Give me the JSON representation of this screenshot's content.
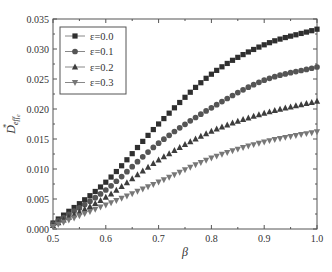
{
  "chart_data": {
    "type": "scatter",
    "title": "",
    "xlabel": "β",
    "ylabel": "D*_eff_e",
    "xlim": [
      0.5,
      1.0
    ],
    "ylim": [
      0.0,
      0.035
    ],
    "xticks": [
      0.5,
      0.6,
      0.7,
      0.8,
      0.9,
      1.0
    ],
    "xtick_labels": [
      "0.5",
      "0.6",
      "0.7",
      "0.8",
      "0.9",
      "1.0"
    ],
    "yticks": [
      0.0,
      0.005,
      0.01,
      0.015,
      0.02,
      0.025,
      0.03,
      0.035
    ],
    "ytick_labels": [
      "0.000",
      "0.005",
      "0.010",
      "0.015",
      "0.020",
      "0.025",
      "0.030",
      "0.035"
    ],
    "grid": false,
    "legend_position": "top-left",
    "x": [
      0.5,
      0.6,
      0.7,
      0.8,
      0.9,
      1.0
    ],
    "series": [
      {
        "name": "ε=0.0",
        "marker": "square",
        "color": "#2f2f2f",
        "values": [
          0.001,
          0.0078,
          0.0175,
          0.0258,
          0.0307,
          0.0333
        ]
      },
      {
        "name": "ε=0.1",
        "marker": "circle",
        "color": "#555555",
        "values": [
          0.0008,
          0.0065,
          0.0143,
          0.0202,
          0.0248,
          0.027
        ]
      },
      {
        "name": "ε=0.2",
        "marker": "triangle-up",
        "color": "#3d3d3d",
        "values": [
          0.0006,
          0.0053,
          0.0115,
          0.0163,
          0.0193,
          0.0213
        ]
      },
      {
        "name": "ε=0.3",
        "marker": "triangle-down",
        "color": "#777777",
        "values": [
          0.0004,
          0.004,
          0.0078,
          0.0118,
          0.0145,
          0.0162
        ]
      }
    ]
  }
}
